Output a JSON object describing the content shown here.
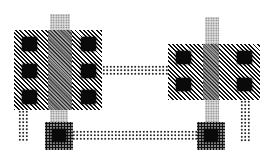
{
  "diagram": {
    "type": "vlsi-layout",
    "colors": {
      "diffusion": "#111111",
      "polysilicon": "#bbbbbb",
      "metal": "#222222",
      "contact": "#0a0a0a",
      "background": "#ffffff"
    },
    "left_transistor": {
      "contacts_left_column": 3,
      "contacts_right_column": 3
    },
    "right_transistor": {
      "contacts_left_column": 2,
      "contacts_right_column": 2
    },
    "bottom_pads": 2
  }
}
